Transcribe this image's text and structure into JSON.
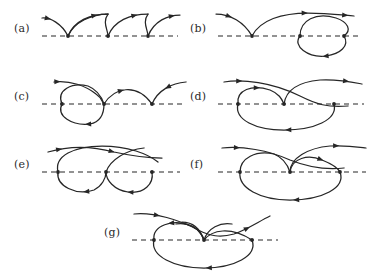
{
  "figure": {
    "type": "diagram",
    "kind": "feynman-like-directed-graph-diagrams",
    "background_color": "#ffffff",
    "line_color": "#262626",
    "baseline_style": "dashed",
    "panel_count": 7,
    "panels": [
      {
        "id": "a",
        "label": "(a)",
        "label_x": 14,
        "label_y": 30,
        "origin_x": 40,
        "origin_y": 6,
        "baseline": {
          "x1": 2,
          "x2": 138,
          "y": 30
        },
        "vertices": [
          {
            "x": 28,
            "y": 30
          },
          {
            "x": 68,
            "y": 30
          },
          {
            "x": 108,
            "y": 30
          }
        ],
        "description": "three successive cusped arches above the dashed baseline, arrows pointing right along each arch",
        "curves": [
          {
            "d": "M 2,12 C 10,11 22,18 28,30",
            "arrows": [
              {
                "t": 0.18,
                "dir": "forward"
              }
            ]
          },
          {
            "d": "M 28,30 C 34,16 52,8 68,8 C 62,8 68,8 68,8",
            "arrows": []
          },
          {
            "d": "M 28,30 C 34,15 50,8 68,8",
            "arrows": [
              {
                "t": 0.72,
                "dir": "forward"
              }
            ]
          },
          {
            "d": "M 68,8 C 62,16 68,24 68,30",
            "arrows": []
          },
          {
            "d": "M 68,30 C 74,15 90,8 108,8",
            "arrows": [
              {
                "t": 0.72,
                "dir": "forward"
              }
            ]
          },
          {
            "d": "M 108,8 C 102,16 108,24 108,30",
            "arrows": []
          },
          {
            "d": "M 108,30 C 114,15 128,9 140,9",
            "arrows": [
              {
                "t": 0.8,
                "dir": "forward"
              }
            ]
          }
        ]
      },
      {
        "id": "b",
        "label": "(b)",
        "label_x": 190,
        "label_y": 30,
        "origin_x": 216,
        "origin_y": 6,
        "baseline": {
          "x1": 2,
          "x2": 146,
          "y": 30
        },
        "vertices": [
          {
            "x": 36,
            "y": 30
          },
          {
            "x": 84,
            "y": 30
          },
          {
            "x": 128,
            "y": 30
          }
        ],
        "description": "a cusp vertex on the left with incoming line, a long arch to the right, and a closed oval loop between the two right-hand vertices",
        "curves": [
          {
            "d": "M 0,8 C 14,8 28,16 36,30",
            "arrows": [
              {
                "t": 0.3,
                "dir": "forward"
              }
            ]
          },
          {
            "d": "M 36,30 C 44,14 66,7 92,7 C 110,7 126,9 138,10",
            "arrows": [
              {
                "t": 0.55,
                "dir": "forward"
              },
              {
                "t": 0.92,
                "dir": "forward"
              }
            ]
          },
          {
            "d": "M 84,30 C 84,14 100,6 120,12 C 132,16 136,24 128,30",
            "arrows": []
          },
          {
            "d": "M 84,30 C 76,40 92,52 110,50 C 124,48 134,40 128,30",
            "arrows": [
              {
                "t": 0.55,
                "dir": "backward"
              }
            ]
          }
        ]
      },
      {
        "id": "c",
        "label": "(c)",
        "label_x": 14,
        "label_y": 98,
        "origin_x": 40,
        "origin_y": 74,
        "baseline": {
          "x1": 2,
          "x2": 146,
          "y": 30
        },
        "vertices": [
          {
            "x": 22,
            "y": 30
          },
          {
            "x": 64,
            "y": 30
          },
          {
            "x": 112,
            "y": 30
          }
        ],
        "description": "mirror of panel b: closed oval loop between the two left vertices, a long arch rightward into a cusp vertex with outgoing line",
        "curves": [
          {
            "d": "M 14,8 C 30,6 46,12 56,20 C 62,24 62,28 64,30",
            "arrows": [
              {
                "t": 0.06,
                "dir": "forward"
              }
            ]
          },
          {
            "d": "M 22,30 C 16,16 32,8 48,12 C 58,16 62,24 64,30",
            "arrows": []
          },
          {
            "d": "M 22,30 C 16,42 32,52 50,50 C 60,48 64,40 64,30",
            "arrows": [
              {
                "t": 0.58,
                "dir": "backward"
              }
            ]
          },
          {
            "d": "M 64,30 C 74,14 96,8 112,30",
            "arrows": [
              {
                "t": 0.38,
                "dir": "forward"
              }
            ]
          },
          {
            "d": "M 112,30 C 118,16 132,9 146,8",
            "arrows": [
              {
                "t": 0.55,
                "dir": "backward"
              }
            ]
          }
        ]
      },
      {
        "id": "d",
        "label": "(d)",
        "label_x": 190,
        "label_y": 98,
        "origin_x": 216,
        "origin_y": 74,
        "baseline": {
          "x1": 2,
          "x2": 148,
          "y": 30
        },
        "vertices": [
          {
            "x": 22,
            "y": 30
          },
          {
            "x": 68,
            "y": 30
          },
          {
            "x": 118,
            "y": 30
          }
        ],
        "description": "crossing lines above the baseline, a small inner loop on the left and a large outer oval below",
        "curves": [
          {
            "d": "M 8,8 C 26,5 56,8 84,22 C 100,30 112,34 132,32",
            "arrows": [
              {
                "t": 0.12,
                "dir": "forward"
              }
            ]
          },
          {
            "d": "M 68,30 C 70,16 82,8 104,6 C 122,5 136,8 146,10",
            "arrows": [
              {
                "t": 0.82,
                "dir": "forward"
              }
            ]
          },
          {
            "d": "M 22,30 C 20,16 36,10 54,16 C 64,20 66,26 68,30",
            "arrows": [
              {
                "t": 0.46,
                "dir": "forward"
              }
            ]
          },
          {
            "d": "M 22,30 C 18,46 40,56 68,56 C 98,56 122,46 118,30",
            "arrows": [
              {
                "t": 0.52,
                "dir": "backward"
              }
            ]
          }
        ]
      },
      {
        "id": "e",
        "label": "(e)",
        "label_x": 14,
        "label_y": 166,
        "origin_x": 40,
        "origin_y": 142,
        "baseline": {
          "x1": 2,
          "x2": 140,
          "y": 30
        },
        "vertices": [
          {
            "x": 18,
            "y": 30
          },
          {
            "x": 66,
            "y": 30
          },
          {
            "x": 112,
            "y": 30
          }
        ],
        "description": "two lines crossing at the top centre, a wide arch over the baseline and two lobes hanging below",
        "curves": [
          {
            "d": "M 8,10 C 28,4 52,4 74,10 C 92,14 108,16 122,16",
            "arrows": [
              {
                "t": 0.1,
                "dir": "forward"
              },
              {
                "t": 0.56,
                "dir": "forward"
              }
            ]
          },
          {
            "d": "M 18,30 C 14,14 34,4 62,4 C 88,4 108,12 118,20",
            "arrows": []
          },
          {
            "d": "M 18,30 C 16,44 36,54 54,48 C 62,44 66,36 66,30",
            "arrows": [
              {
                "t": 0.56,
                "dir": "backward"
              }
            ]
          },
          {
            "d": "M 66,30 C 66,38 74,48 88,50 C 104,52 114,42 112,30",
            "arrows": [
              {
                "t": 0.5,
                "dir": "backward"
              }
            ]
          },
          {
            "d": "M 66,30 C 70,18 86,8 104,6",
            "arrows": []
          }
        ]
      },
      {
        "id": "f",
        "label": "(f)",
        "label_x": 190,
        "label_y": 166,
        "origin_x": 216,
        "origin_y": 142,
        "baseline": {
          "x1": 2,
          "x2": 150,
          "y": 30
        },
        "vertices": [
          {
            "x": 24,
            "y": 30
          },
          {
            "x": 74,
            "y": 30
          },
          {
            "x": 124,
            "y": 30
          }
        ],
        "description": "crossing lines at the top, a small right-hand inner loop and a large outer oval below the baseline",
        "curves": [
          {
            "d": "M 6,6 C 26,4 52,8 74,18 C 94,26 110,28 128,26",
            "arrows": [
              {
                "t": 0.12,
                "dir": "forward"
              }
            ]
          },
          {
            "d": "M 74,30 C 74,16 92,6 114,4 C 130,3 142,5 150,6",
            "arrows": [
              {
                "t": 0.66,
                "dir": "forward"
              }
            ]
          },
          {
            "d": "M 74,30 C 76,16 92,12 106,18 C 116,22 122,26 124,30",
            "arrows": [
              {
                "t": 0.62,
                "dir": "forward"
              }
            ]
          },
          {
            "d": "M 24,30 C 22,46 44,58 74,58 C 106,58 130,46 124,30",
            "arrows": [
              {
                "t": 0.54,
                "dir": "backward"
              }
            ]
          },
          {
            "d": "M 24,30 C 24,16 40,8 58,12 C 68,16 72,24 74,30",
            "arrows": []
          }
        ]
      },
      {
        "id": "g",
        "label": "(g)",
        "label_x": 104,
        "label_y": 234,
        "origin_x": 130,
        "origin_y": 210,
        "baseline": {
          "x1": 2,
          "x2": 148,
          "y": 30
        },
        "vertices": [
          {
            "x": 24,
            "y": 30
          },
          {
            "x": 74,
            "y": 30
          },
          {
            "x": 122,
            "y": 30
          }
        ],
        "description": "two lines crossing above the centre vertex forming a V, a left arch, and a large outer oval below the baseline",
        "curves": [
          {
            "d": "M 4,4 C 24,2 50,10 68,20 C 80,26 90,28 104,24 C 116,20 128,12 140,6",
            "arrows": [
              {
                "t": 0.16,
                "dir": "forward"
              },
              {
                "t": 0.82,
                "dir": "forward"
              }
            ]
          },
          {
            "d": "M 74,30 C 70,18 62,12 52,12 C 62,12 70,18 74,30",
            "arrows": []
          },
          {
            "d": "M 74,30 C 70,18 58,12 46,14",
            "arrows": []
          },
          {
            "d": "M 74,30 C 78,18 90,12 102,14",
            "arrows": []
          },
          {
            "d": "M 24,30 C 22,16 42,8 62,16 C 70,20 72,26 74,30",
            "arrows": [
              {
                "t": 0.4,
                "dir": "backward"
              }
            ]
          },
          {
            "d": "M 24,30 C 20,46 44,58 74,58 C 104,58 128,46 122,30",
            "arrows": [
              {
                "t": 0.54,
                "dir": "backward"
              }
            ]
          },
          {
            "d": "M 74,30 C 82,20 100,16 122,30",
            "arrows": []
          }
        ]
      }
    ]
  }
}
